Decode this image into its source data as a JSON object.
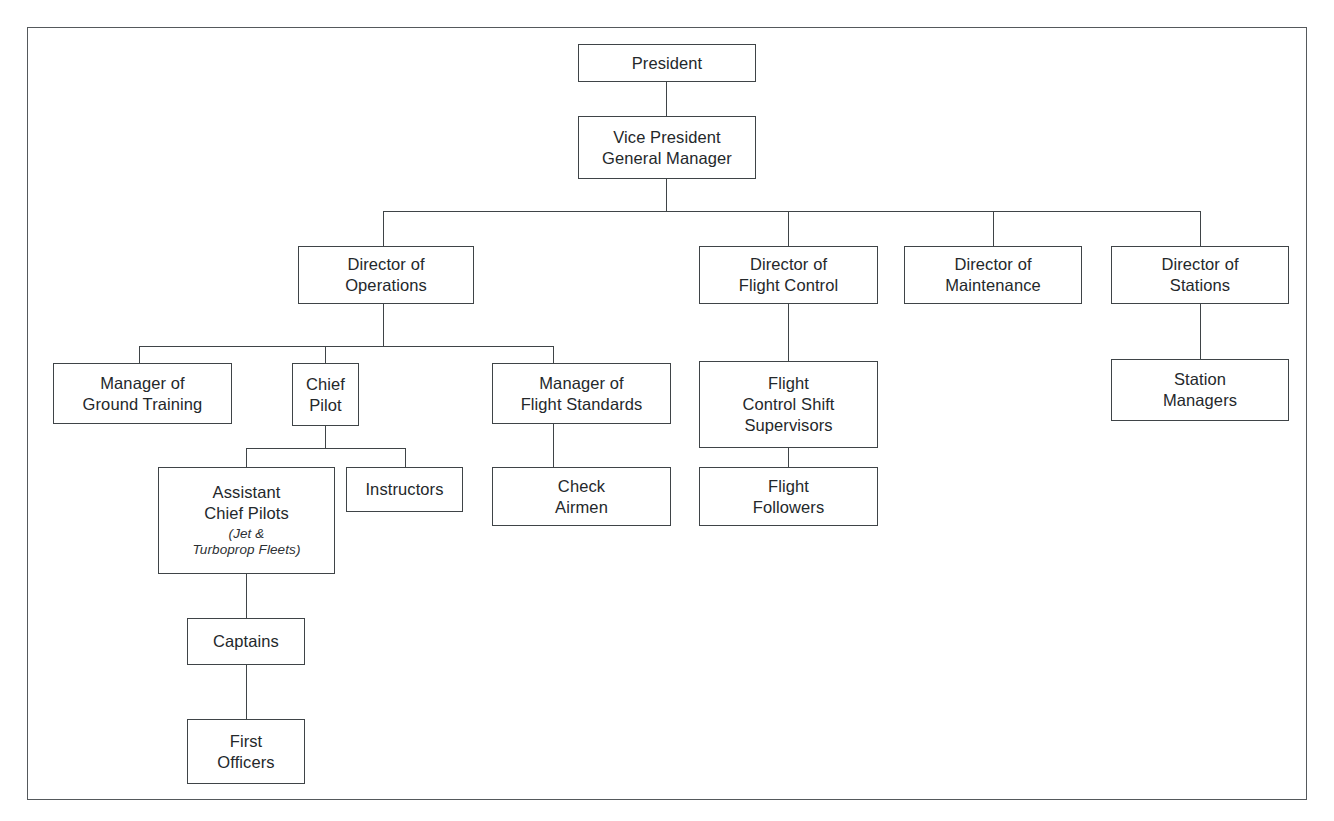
{
  "diagram": {
    "kind": "organizational-chart",
    "frame_color": "#55595c",
    "box_border_color": "#3f4447",
    "text_color": "#24282b",
    "background": "#ffffff"
  },
  "nodes": {
    "president": {
      "title": "President"
    },
    "vice_president": {
      "title": "Vice President\nGeneral Manager"
    },
    "dir_operations": {
      "title": "Director of\nOperations"
    },
    "dir_flight_control": {
      "title": "Director of\nFlight Control"
    },
    "dir_maintenance": {
      "title": "Director of\nMaintenance"
    },
    "dir_stations": {
      "title": "Director of\nStations"
    },
    "mgr_ground_training": {
      "title": "Manager of\nGround Training"
    },
    "chief_pilot": {
      "title": "Chief\nPilot"
    },
    "mgr_flight_standards": {
      "title": "Manager of\nFlight Standards"
    },
    "flight_control_shift_supervisors": {
      "title": "Flight\nControl Shift\nSupervisors"
    },
    "station_managers": {
      "title": "Station\nManagers"
    },
    "assistant_chief_pilots": {
      "title": "Assistant\nChief Pilots",
      "subtitle": "(Jet &\nTurboprop Fleets)"
    },
    "instructors": {
      "title": "Instructors"
    },
    "check_airmen": {
      "title": "Check\nAirmen"
    },
    "flight_followers": {
      "title": "Flight\nFollowers"
    },
    "captains": {
      "title": "Captains"
    },
    "first_officers": {
      "title": "First\nOfficers"
    }
  },
  "hierarchy": {
    "root": "president",
    "edges": [
      [
        "president",
        "vice_president"
      ],
      [
        "vice_president",
        "dir_operations"
      ],
      [
        "vice_president",
        "dir_flight_control"
      ],
      [
        "vice_president",
        "dir_maintenance"
      ],
      [
        "vice_president",
        "dir_stations"
      ],
      [
        "dir_operations",
        "mgr_ground_training"
      ],
      [
        "dir_operations",
        "chief_pilot"
      ],
      [
        "dir_operations",
        "mgr_flight_standards"
      ],
      [
        "dir_flight_control",
        "flight_control_shift_supervisors"
      ],
      [
        "dir_stations",
        "station_managers"
      ],
      [
        "chief_pilot",
        "assistant_chief_pilots"
      ],
      [
        "chief_pilot",
        "instructors"
      ],
      [
        "mgr_flight_standards",
        "check_airmen"
      ],
      [
        "flight_control_shift_supervisors",
        "flight_followers"
      ],
      [
        "assistant_chief_pilots",
        "captains"
      ],
      [
        "captains",
        "first_officers"
      ]
    ]
  }
}
